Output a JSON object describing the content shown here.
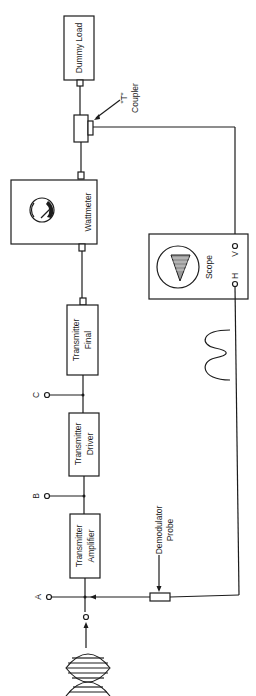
{
  "diagram": {
    "orientation": "rotated-90-ccw",
    "line_color": "#1c1c1c",
    "background": "#ffffff",
    "blocks": {
      "dummy_load": {
        "label": "Dummy Load"
      },
      "t_coupler": {
        "label_line1": "\"T\"",
        "label_line2": "Coupler"
      },
      "wattmeter": {
        "label": "Wattmeter"
      },
      "scope": {
        "label": "Scope",
        "terminal_v": "V",
        "terminal_h": "H"
      },
      "transmitter_final": {
        "label_line1": "Transmitter",
        "label_line2": "Final"
      },
      "transmitter_driver": {
        "label_line1": "Transmitter",
        "label_line2": "Driver"
      },
      "transmitter_amplifier": {
        "label_line1": "Transmitter",
        "label_line2": "Amplifier"
      },
      "demodulator_probe": {
        "label_line1": "Demodulator",
        "label_line2": "Probe"
      }
    },
    "test_points": [
      {
        "id": "A",
        "label": "A"
      },
      {
        "id": "B",
        "label": "B"
      },
      {
        "id": "C",
        "label": "C"
      }
    ],
    "signals": {
      "input": "modulated-rf-envelope",
      "demodulated": "demodulated-waveform"
    }
  }
}
